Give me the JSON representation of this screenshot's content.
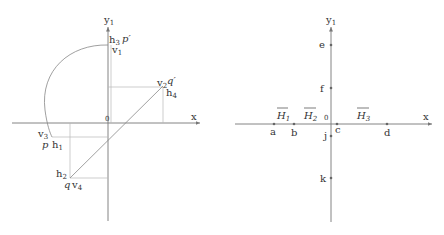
{
  "left_diagram": {
    "axes": {
      "x_label": "x",
      "y_label": "y",
      "y_subscript": "1",
      "origin_label": "0"
    },
    "points": {
      "p_prime": {
        "label": "p′",
        "h": "h",
        "h_sub": "3",
        "v": "v",
        "v_sub": "1"
      },
      "q_prime": {
        "label": "q′",
        "v": "v",
        "v_sub": "2",
        "h": "h",
        "h_sub": "4"
      },
      "p": {
        "label": "p",
        "v": "v",
        "v_sub": "3",
        "h": "h",
        "h_sub": "1"
      },
      "q": {
        "label": "q",
        "h": "h",
        "h_sub": "2",
        "v": "v",
        "v_sub": "4"
      }
    }
  },
  "right_diagram": {
    "axes": {
      "x_label": "x",
      "y_label": "y",
      "y_subscript": "1",
      "origin_label": "0"
    },
    "x_points": [
      {
        "label": "a"
      },
      {
        "label": "b"
      },
      {
        "label": "c"
      },
      {
        "label": "d"
      }
    ],
    "y_points": [
      {
        "label": "e"
      },
      {
        "label": "f"
      },
      {
        "label": "j"
      },
      {
        "label": "k"
      }
    ],
    "intervals": [
      {
        "label": "H",
        "sub": "1"
      },
      {
        "label": "H",
        "sub": "2"
      },
      {
        "label": "H",
        "sub": "3"
      }
    ]
  }
}
